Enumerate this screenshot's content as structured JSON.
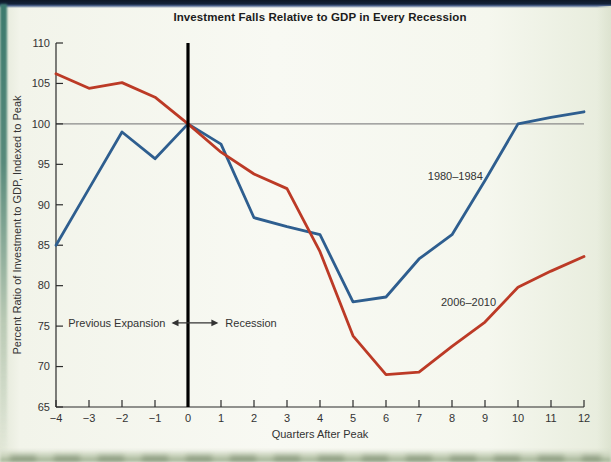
{
  "page": {
    "background_color": "#f2f4ea",
    "top_band_color": "#14233a",
    "left_edge_color": "#3c7a6e"
  },
  "chart_data": {
    "type": "line",
    "title": "Investment Falls Relative to GDP in Every Recession",
    "xlabel": "Quarters After Peak",
    "ylabel": "Percent Ratio of Investment to GDP, Indexed to Peak",
    "xlim": [
      -4,
      12
    ],
    "ylim": [
      65,
      110
    ],
    "x_ticks": [
      -4,
      -3,
      -2,
      -1,
      0,
      1,
      2,
      3,
      4,
      5,
      6,
      7,
      8,
      9,
      10,
      11,
      12
    ],
    "y_ticks": [
      65,
      70,
      75,
      80,
      85,
      90,
      95,
      100,
      105,
      110
    ],
    "grid": "off",
    "legend_position": "inline-labels",
    "axis_color": "#2b2b2b",
    "text_color": "#333333",
    "reference_line": {
      "y": 100,
      "color": "#8a8a8a"
    },
    "event_line": {
      "x": 0,
      "color": "#000000"
    },
    "annotation": {
      "left_label": "Previous Expansion",
      "right_label": "Recession",
      "y": 75.4,
      "arrow_x1": -0.5,
      "arrow_x2": 0.92,
      "color": "#333333"
    },
    "x": [
      -4,
      -3,
      -2,
      -1,
      0,
      1,
      2,
      3,
      4,
      5,
      6,
      7,
      8,
      9,
      10,
      11,
      12
    ],
    "series": [
      {
        "name": "1980–1984",
        "color": "#2e5e8f",
        "label_pos": {
          "x": 8.1,
          "y": 93.5
        },
        "values": [
          85,
          92,
          99,
          95.7,
          100,
          97.5,
          88.4,
          87.3,
          86.3,
          78,
          78.6,
          83.3,
          86.3,
          93,
          100,
          100.8,
          101.5
        ]
      },
      {
        "name": "2006–2010",
        "color": "#bc3a26",
        "label_pos": {
          "x": 8.5,
          "y": 78
        },
        "values": [
          106.2,
          104.4,
          105.1,
          103.3,
          100,
          96.5,
          93.8,
          92,
          84.2,
          73.8,
          69,
          69.3,
          72.5,
          75.5,
          79.8,
          81.8,
          83.6
        ]
      }
    ]
  }
}
